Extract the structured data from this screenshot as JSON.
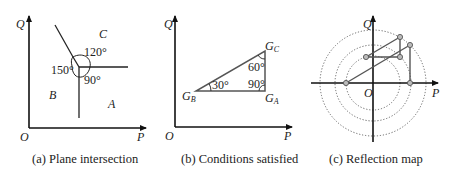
{
  "figure": {
    "panels": [
      {
        "id": "a",
        "caption": "(a) Plane intersection",
        "axes": {
          "x_label": "P",
          "y_label": "Q",
          "origin_label": "O"
        },
        "regions": [
          "A",
          "B",
          "C"
        ],
        "angles": [
          "120°",
          "150°",
          "90°"
        ]
      },
      {
        "id": "b",
        "caption": "(b) Conditions satisfied",
        "axes": {
          "x_label": "P",
          "y_label": "Q",
          "origin_label": "O"
        },
        "vertices": [
          {
            "base": "G",
            "sub": "B"
          },
          {
            "base": "G",
            "sub": "A"
          },
          {
            "base": "G",
            "sub": "C"
          }
        ],
        "angles": [
          "30°",
          "60°",
          "90°"
        ]
      },
      {
        "id": "c",
        "caption": "(c) Reflection map",
        "axes": {
          "x_label": "P",
          "y_label": "Q",
          "origin_label": "O"
        },
        "circles": 3
      }
    ],
    "colors": {
      "line": "#222222",
      "gray_line": "#555555",
      "dotted": "#666666",
      "point_fill": "#bbbbbb"
    }
  }
}
